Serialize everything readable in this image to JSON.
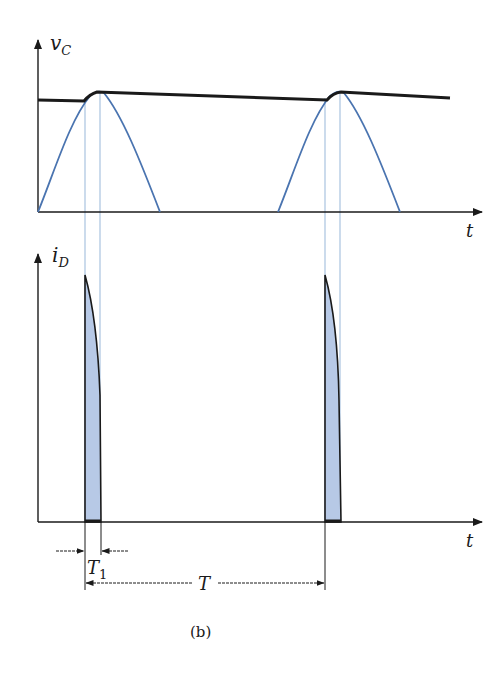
{
  "figure": {
    "caption": "(b)",
    "colors": {
      "axis": "#1a1a1a",
      "envelope": "#1a1a1a",
      "sine": "#4a74b0",
      "guide": "#a9c3e0",
      "pulse_fill": "#b7c9e6"
    }
  },
  "top_plot": {
    "y_label_main": "v",
    "y_label_sub": "C",
    "x_label": "t",
    "description": "Capacitor voltage v_C: black ripple envelope over rectified blue sine half-waves"
  },
  "bottom_plot": {
    "y_label_main": "i",
    "y_label_sub": "D",
    "x_label": "t",
    "description": "Diode current i_D: narrow shaded pulses during conduction interval"
  },
  "dimensions": {
    "t1_main": "T",
    "t1_sub": "1",
    "period": "T"
  }
}
